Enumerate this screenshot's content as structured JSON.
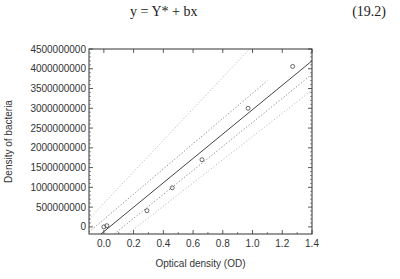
{
  "equation": {
    "text": "y = Y* + bx",
    "number": "(19.2)"
  },
  "chart_data": {
    "type": "scatter",
    "title": "",
    "xlabel": "Optical density (OD)",
    "ylabel": "Density of bacteria",
    "xlim": [
      -0.1,
      1.4
    ],
    "ylim": [
      -180000000,
      4500000000
    ],
    "xticks": [
      0.0,
      0.2,
      0.4,
      0.6,
      0.8,
      1.0,
      1.2,
      1.4
    ],
    "xtick_labels": [
      "0.0",
      "0.2",
      "0.4",
      "0.6",
      "0.8",
      "1.0",
      "1.2",
      "1.4"
    ],
    "yticks": [
      0,
      500000000,
      1000000000,
      1500000000,
      2000000000,
      2500000000,
      3000000000,
      3500000000,
      4000000000,
      4500000000
    ],
    "ytick_labels": [
      "0",
      "500000000",
      "1000000000",
      "1500000000",
      "2000000000",
      "2500000000",
      "3000000000",
      "3500000000",
      "4000000000",
      "4500000000"
    ],
    "grid": false,
    "series": [
      {
        "name": "observations",
        "kind": "points",
        "marker": "open-circle",
        "x": [
          0.0,
          0.02,
          0.29,
          0.46,
          0.66,
          0.97,
          1.27
        ],
        "y": [
          0,
          30000000,
          410000000,
          990000000,
          1700000000,
          3000000000,
          4060000000
        ]
      },
      {
        "name": "regression line",
        "kind": "line",
        "style": "solid",
        "x": [
          -0.02,
          1.4
        ],
        "y": [
          -180000000,
          4200000000
        ]
      },
      {
        "name": "confidence band upper",
        "kind": "line",
        "style": "dotted",
        "x": [
          -0.1,
          1.1
        ],
        "y": [
          -130000000,
          3700000000
        ]
      },
      {
        "name": "confidence band lower",
        "kind": "line",
        "style": "dotted",
        "x": [
          0.07,
          1.4
        ],
        "y": [
          -180000000,
          3860000000
        ]
      },
      {
        "name": "prediction band upper",
        "kind": "line",
        "style": "dotted-light",
        "x": [
          -0.1,
          0.98
        ],
        "y": [
          200000000,
          4500000000
        ]
      },
      {
        "name": "prediction band lower",
        "kind": "line",
        "style": "dotted-light",
        "x": [
          0.16,
          1.4
        ],
        "y": [
          -180000000,
          3460000000
        ]
      }
    ],
    "colors": {
      "axis": "#333333",
      "points": "#444444",
      "line": "#444444",
      "band": "#888888",
      "band_light": "#bbbbbb"
    }
  }
}
